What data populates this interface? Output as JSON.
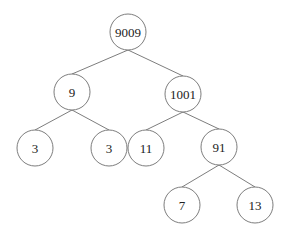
{
  "diagram": {
    "type": "binary-tree",
    "node_radius": 18,
    "nodes": [
      {
        "id": "n9009",
        "label": "9009",
        "x": 128,
        "y": 32
      },
      {
        "id": "n9",
        "label": "9",
        "x": 72,
        "y": 92
      },
      {
        "id": "n1001",
        "label": "1001",
        "x": 183,
        "y": 94
      },
      {
        "id": "n3a",
        "label": "3",
        "x": 35,
        "y": 148
      },
      {
        "id": "n3b",
        "label": "3",
        "x": 109,
        "y": 148
      },
      {
        "id": "n11",
        "label": "11",
        "x": 146,
        "y": 148
      },
      {
        "id": "n91",
        "label": "91",
        "x": 219,
        "y": 147
      },
      {
        "id": "n7",
        "label": "7",
        "x": 182,
        "y": 205
      },
      {
        "id": "n13",
        "label": "13",
        "x": 255,
        "y": 205
      }
    ],
    "edges": [
      {
        "from": "n9009",
        "to": "n9"
      },
      {
        "from": "n9009",
        "to": "n1001"
      },
      {
        "from": "n9",
        "to": "n3a"
      },
      {
        "from": "n9",
        "to": "n3b"
      },
      {
        "from": "n1001",
        "to": "n11"
      },
      {
        "from": "n1001",
        "to": "n91"
      },
      {
        "from": "n91",
        "to": "n7"
      },
      {
        "from": "n91",
        "to": "n13"
      }
    ],
    "colors": {
      "stroke": "#6e6e6e",
      "text": "#222222",
      "background": "#ffffff"
    }
  }
}
